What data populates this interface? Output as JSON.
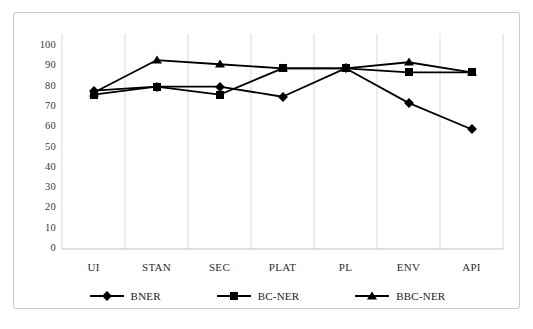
{
  "chart_data": {
    "type": "line",
    "title": "",
    "subtitle": "",
    "xlabel": "",
    "ylabel": "",
    "categories": [
      "UI",
      "STAN",
      "SEC",
      "PLAT",
      "PL",
      "ENV",
      "API"
    ],
    "ylim": [
      0,
      100
    ],
    "yticks": [
      0,
      10,
      20,
      30,
      40,
      50,
      60,
      70,
      80,
      90,
      100
    ],
    "ytick_labels": [
      "0",
      "10",
      "20",
      "30",
      "40",
      "50",
      "60",
      "70",
      "80",
      "90",
      "100"
    ],
    "grid": {
      "vertical": true,
      "horizontal": false,
      "color": "#d9d9d9"
    },
    "legend": {
      "position": "bottom",
      "entries": [
        "BNER",
        "BC-NER",
        "BBC-NER"
      ]
    },
    "series": [
      {
        "name": "BNER",
        "marker": "diamond",
        "color": "#000000",
        "values": [
          78,
          80,
          80,
          75,
          89,
          72,
          59
        ]
      },
      {
        "name": "BC-NER",
        "marker": "square",
        "color": "#000000",
        "values": [
          76,
          80,
          76,
          89,
          89,
          87,
          87
        ]
      },
      {
        "name": "BBC-NER",
        "marker": "triangle",
        "color": "#000000",
        "values": [
          77,
          93,
          91,
          89,
          89,
          92,
          87
        ]
      }
    ]
  }
}
